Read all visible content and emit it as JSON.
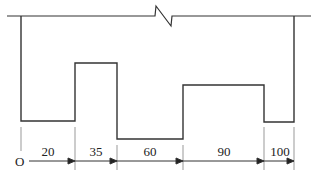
{
  "diagram": {
    "type": "step-profile-with-break",
    "origin_label": "O",
    "dimension_labels": [
      "20",
      "35",
      "60",
      "90",
      "100"
    ],
    "colors": {
      "line": "#333333",
      "background": "#ffffff"
    },
    "profile_levels": [
      "low",
      "high",
      "lowest",
      "mid",
      "low"
    ],
    "top_line_has_break": true
  }
}
